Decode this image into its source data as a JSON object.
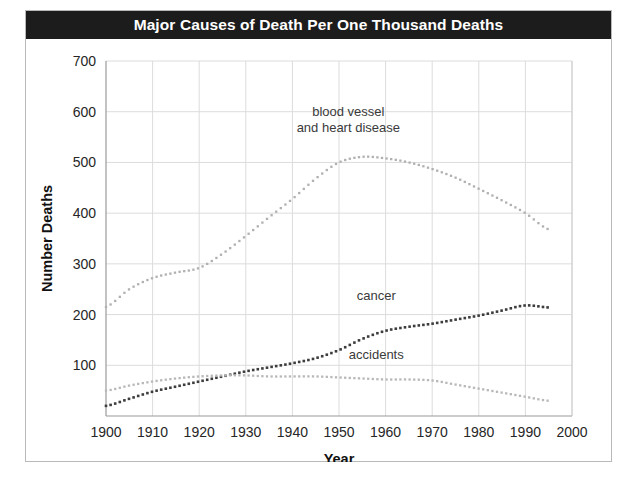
{
  "figure": {
    "title": "Major Causes of Death Per One Thousand Deaths",
    "caption_partial": ""
  },
  "chart_data": {
    "type": "line",
    "title": "Major Causes of Death Per One Thousand Deaths",
    "subtitle": "",
    "xlabel": "Year",
    "ylabel": "Number Deaths",
    "xlim": [
      1900,
      2000
    ],
    "ylim": [
      0,
      700
    ],
    "xticks": [
      1900,
      1910,
      1920,
      1930,
      1940,
      1950,
      1960,
      1970,
      1980,
      1990,
      2000
    ],
    "yticks": [
      100,
      200,
      300,
      400,
      500,
      600,
      700
    ],
    "grid": true,
    "legend": "inline-annotations",
    "marker": "dotted",
    "series": [
      {
        "name": "blood vessel and heart disease",
        "label_lines": [
          "blood vessel",
          "and heart disease"
        ],
        "label_x": 1952,
        "label_y": 592,
        "color": "#b0b0b0",
        "x": [
          1900,
          1905,
          1910,
          1915,
          1920,
          1925,
          1930,
          1935,
          1940,
          1945,
          1950,
          1955,
          1960,
          1965,
          1970,
          1975,
          1980,
          1985,
          1990,
          1995
        ],
        "y": [
          215,
          250,
          272,
          283,
          292,
          320,
          355,
          392,
          428,
          468,
          500,
          511,
          508,
          500,
          487,
          470,
          448,
          425,
          400,
          368
        ]
      },
      {
        "name": "cancer",
        "label_lines": [
          "cancer"
        ],
        "label_x": 1958,
        "label_y": 228,
        "color": "#3d3d3d",
        "x": [
          1900,
          1905,
          1910,
          1915,
          1920,
          1925,
          1930,
          1935,
          1940,
          1945,
          1950,
          1955,
          1960,
          1965,
          1970,
          1975,
          1980,
          1985,
          1990,
          1995
        ],
        "y": [
          20,
          34,
          48,
          58,
          68,
          78,
          88,
          96,
          104,
          114,
          130,
          152,
          168,
          176,
          182,
          190,
          198,
          208,
          218,
          214
        ]
      },
      {
        "name": "accidents",
        "label_lines": [
          "accidents"
        ],
        "label_x": 1958,
        "label_y": 112,
        "color": "#b8b8b8",
        "x": [
          1900,
          1905,
          1910,
          1915,
          1920,
          1925,
          1930,
          1935,
          1940,
          1945,
          1950,
          1955,
          1960,
          1965,
          1970,
          1975,
          1980,
          1985,
          1990,
          1995
        ],
        "y": [
          50,
          60,
          68,
          74,
          78,
          80,
          80,
          78,
          78,
          78,
          76,
          74,
          72,
          72,
          70,
          62,
          54,
          46,
          38,
          30
        ]
      }
    ]
  }
}
